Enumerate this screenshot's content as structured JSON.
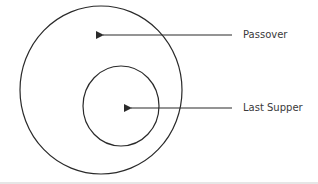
{
  "diagram": {
    "type": "nested-circles",
    "labels": {
      "outer": "Passover",
      "inner": "Last Supper"
    },
    "colors": {
      "stroke": "#2a2a2a",
      "text": "#3a3a3a",
      "background": "#ffffff",
      "bottom_band": "#e6e6e6"
    },
    "shapes": [
      {
        "id": "outer-circle",
        "cx": 101,
        "cy": 90,
        "rx": 81,
        "ry": 84,
        "label": "Passover"
      },
      {
        "id": "inner-circle",
        "cx": 121,
        "cy": 106,
        "rx": 38,
        "ry": 40,
        "label": "Last Supper"
      }
    ],
    "arrows": [
      {
        "from": "Passover",
        "x1": 232,
        "y1": 35,
        "x2": 101,
        "y2": 35
      },
      {
        "from": "Last Supper",
        "x1": 232,
        "y1": 108,
        "x2": 129,
        "y2": 108
      }
    ]
  }
}
